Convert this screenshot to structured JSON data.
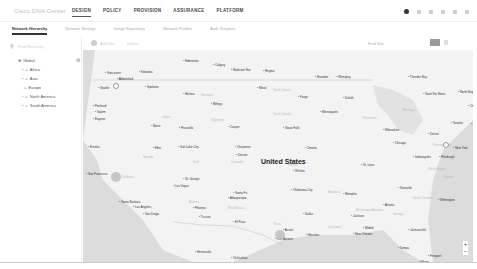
{
  "app": {
    "brand": "Cisco DNA Center"
  },
  "nav": {
    "tabs": [
      {
        "label": "DESIGN",
        "active": true
      },
      {
        "label": "POLICY"
      },
      {
        "label": "PROVISION"
      },
      {
        "label": "ASSURANCE"
      },
      {
        "label": "PLATFORM"
      }
    ]
  },
  "subnav": {
    "tabs": [
      {
        "label": "Network Hierarchy",
        "active": true
      },
      {
        "label": "Network Settings"
      },
      {
        "label": "Image Repository"
      },
      {
        "label": "Network Profiles"
      },
      {
        "label": "Auth Template"
      }
    ]
  },
  "sidebar": {
    "search_placeholder": "Find Hierarchy",
    "tree": [
      {
        "label": "Global",
        "level": 0
      },
      {
        "label": "Africa",
        "level": 1
      },
      {
        "label": "Asia",
        "level": 1
      },
      {
        "label": "Europe",
        "level": 1
      },
      {
        "label": "North America",
        "level": 1
      },
      {
        "label": "South America",
        "level": 1
      }
    ]
  },
  "map_toolbar": {
    "add_site": "Add Site",
    "delete": "Delete",
    "filter": "Find Site"
  },
  "map": {
    "country": "United States",
    "cities": [
      {
        "name": "Calgary",
        "x": 130,
        "y": 13
      },
      {
        "name": "Edmonton",
        "x": 100,
        "y": 9
      },
      {
        "name": "Regina",
        "x": 180,
        "y": 19
      },
      {
        "name": "Medicine Hat",
        "x": 148,
        "y": 18
      },
      {
        "name": "Brandon",
        "x": 232,
        "y": 25
      },
      {
        "name": "Winnipeg",
        "x": 253,
        "y": 25
      },
      {
        "name": "Thunder Bay",
        "x": 325,
        "y": 25
      },
      {
        "name": "Vancouver",
        "x": 22,
        "y": 21
      },
      {
        "name": "Kelowna",
        "x": 56,
        "y": 20
      },
      {
        "name": "Abbotsford",
        "x": 34,
        "y": 27
      },
      {
        "name": "Seattle",
        "x": 15,
        "y": 36
      },
      {
        "name": "Spokane",
        "x": 62,
        "y": 35
      },
      {
        "name": "Helena",
        "x": 100,
        "y": 42
      },
      {
        "name": "Billings",
        "x": 128,
        "y": 52
      },
      {
        "name": "Minot",
        "x": 174,
        "y": 36
      },
      {
        "name": "Fargo",
        "x": 215,
        "y": 45
      },
      {
        "name": "Duluth",
        "x": 260,
        "y": 46
      },
      {
        "name": "Sault Ste Marie",
        "x": 340,
        "y": 42
      },
      {
        "name": "North Bay",
        "x": 375,
        "y": 40
      },
      {
        "name": "Portland",
        "x": 10,
        "y": 54
      },
      {
        "name": "Salem",
        "x": 12,
        "y": 60
      },
      {
        "name": "Minneapolis",
        "x": 237,
        "y": 60
      },
      {
        "name": "Eugene",
        "x": 10,
        "y": 67
      },
      {
        "name": "Boise",
        "x": 68,
        "y": 74
      },
      {
        "name": "Pocatello",
        "x": 96,
        "y": 76
      },
      {
        "name": "Casper",
        "x": 145,
        "y": 75
      },
      {
        "name": "Sioux Falls",
        "x": 200,
        "y": 76
      },
      {
        "name": "Milwaukee",
        "x": 300,
        "y": 78
      },
      {
        "name": "Detroit",
        "x": 345,
        "y": 82
      },
      {
        "name": "Chicago",
        "x": 310,
        "y": 91
      },
      {
        "name": "Toronto",
        "x": 368,
        "y": 71
      },
      {
        "name": "Ottawa",
        "x": 385,
        "y": 54
      },
      {
        "name": "Eureka",
        "x": 5,
        "y": 95
      },
      {
        "name": "Elko",
        "x": 70,
        "y": 96
      },
      {
        "name": "Salt Lake City",
        "x": 95,
        "y": 95
      },
      {
        "name": "Cheyenne",
        "x": 152,
        "y": 95
      },
      {
        "name": "Omaha",
        "x": 222,
        "y": 96
      },
      {
        "name": "Denver",
        "x": 153,
        "y": 103
      },
      {
        "name": "St. Louis",
        "x": 278,
        "y": 113
      },
      {
        "name": "Pittsburgh",
        "x": 356,
        "y": 105
      },
      {
        "name": "Indianapolis",
        "x": 330,
        "y": 105
      },
      {
        "name": "Wichita",
        "x": 210,
        "y": 119
      },
      {
        "name": "San Francisco",
        "x": 3,
        "y": 122
      },
      {
        "name": "St. George",
        "x": 100,
        "y": 127
      },
      {
        "name": "Las Vegas",
        "x": 90,
        "y": 134
      },
      {
        "name": "Santa Fe",
        "x": 150,
        "y": 141
      },
      {
        "name": "Albuquerque",
        "x": 145,
        "y": 146
      },
      {
        "name": "Oklahoma City",
        "x": 208,
        "y": 138
      },
      {
        "name": "Memphis",
        "x": 260,
        "y": 142
      },
      {
        "name": "Knoxville",
        "x": 315,
        "y": 136
      },
      {
        "name": "Atlanta",
        "x": 300,
        "y": 153
      },
      {
        "name": "Wilmington",
        "x": 355,
        "y": 148
      },
      {
        "name": "Santa Barbara",
        "x": 36,
        "y": 150
      },
      {
        "name": "Los Angeles",
        "x": 50,
        "y": 155
      },
      {
        "name": "Phoenix",
        "x": 110,
        "y": 156
      },
      {
        "name": "San Diego",
        "x": 60,
        "y": 162
      },
      {
        "name": "Tucson",
        "x": 116,
        "y": 165
      },
      {
        "name": "El Paso",
        "x": 150,
        "y": 170
      },
      {
        "name": "Dallas",
        "x": 220,
        "y": 162
      },
      {
        "name": "Jackson",
        "x": 268,
        "y": 164
      },
      {
        "name": "Austin",
        "x": 200,
        "y": 178
      },
      {
        "name": "San Antonio",
        "x": 192,
        "y": 187
      },
      {
        "name": "Houston",
        "x": 223,
        "y": 183
      },
      {
        "name": "Mobile",
        "x": 280,
        "y": 176
      },
      {
        "name": "New Orleans",
        "x": 270,
        "y": 182
      },
      {
        "name": "Jacksonville",
        "x": 325,
        "y": 178
      },
      {
        "name": "Hermosillo",
        "x": 112,
        "y": 200
      },
      {
        "name": "Chihuahua",
        "x": 148,
        "y": 206
      },
      {
        "name": "Tampa",
        "x": 315,
        "y": 196
      },
      {
        "name": "Freeport",
        "x": 345,
        "y": 204
      },
      {
        "name": "Miami",
        "x": 336,
        "y": 210
      },
      {
        "name": "Bahamas",
        "x": 360,
        "y": 217
      },
      {
        "name": "Monterrey",
        "x": 182,
        "y": 220
      },
      {
        "name": "Culiacan",
        "x": 128,
        "y": 224
      },
      {
        "name": "Torreon",
        "x": 148,
        "y": 220
      },
      {
        "name": "New York",
        "x": 370,
        "y": 96
      },
      {
        "name": "Augusta",
        "x": 388,
        "y": 72
      }
    ],
    "states": [
      {
        "name": "Montana",
        "x": 118,
        "y": 43
      },
      {
        "name": "North Dakota",
        "x": 190,
        "y": 38
      },
      {
        "name": "South Dakota",
        "x": 190,
        "y": 62
      },
      {
        "name": "Wisconsin",
        "x": 280,
        "y": 66
      },
      {
        "name": "Michigan",
        "x": 320,
        "y": 58
      },
      {
        "name": "Idaho",
        "x": 80,
        "y": 65
      },
      {
        "name": "Wyoming",
        "x": 128,
        "y": 68
      },
      {
        "name": "Nevada",
        "x": 60,
        "y": 105
      },
      {
        "name": "Utah",
        "x": 110,
        "y": 110
      },
      {
        "name": "Colorado",
        "x": 148,
        "y": 110
      },
      {
        "name": "Kansas",
        "x": 205,
        "y": 113
      },
      {
        "name": "California",
        "x": 38,
        "y": 125
      },
      {
        "name": "Arizona",
        "x": 106,
        "y": 150
      },
      {
        "name": "New Mexico",
        "x": 145,
        "y": 156
      },
      {
        "name": "Texas",
        "x": 190,
        "y": 172
      },
      {
        "name": "Arkansas",
        "x": 245,
        "y": 140
      },
      {
        "name": "Mississippi Alabama",
        "x": 273,
        "y": 158
      },
      {
        "name": "Georgia",
        "x": 310,
        "y": 162
      },
      {
        "name": "South Carolina",
        "x": 330,
        "y": 146
      },
      {
        "name": "Louisiana",
        "x": 245,
        "y": 175
      },
      {
        "name": "Pennsylvania",
        "x": 350,
        "y": 93
      },
      {
        "name": "West Virginia",
        "x": 345,
        "y": 117
      },
      {
        "name": "Virginia",
        "x": 360,
        "y": 125
      }
    ],
    "pins": [
      {
        "label": "Washington",
        "x": 30,
        "y": 33
      },
      {
        "label": "New York",
        "x": 360,
        "y": 92
      }
    ],
    "clusters": [
      {
        "x": 28,
        "y": 122
      },
      {
        "x": 192,
        "y": 180
      }
    ]
  }
}
